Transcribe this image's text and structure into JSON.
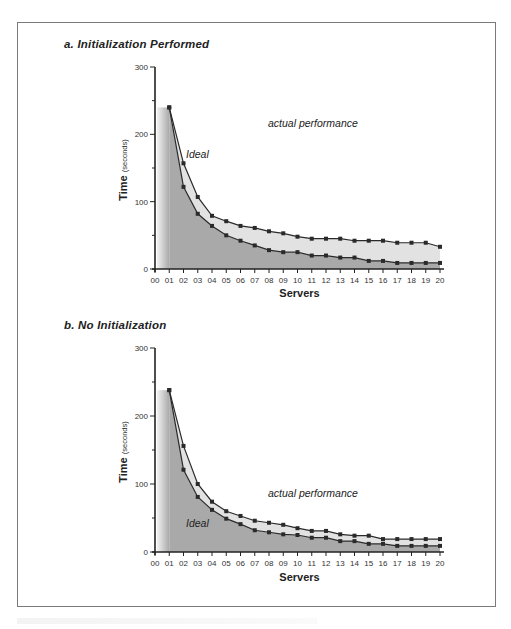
{
  "figure": {
    "colors": {
      "ideal_fill": "#a9a9a9",
      "actual_fill": "#e2e2e2",
      "line": "#2a2a2a",
      "frame": "#7a7a7a"
    }
  },
  "panels": [
    {
      "title": "a. Initialization Performed",
      "xlabel": "Servers",
      "ylabel": "Time",
      "ylabel_unit": "(seconds)",
      "annot_actual": "actual performance",
      "annot_ideal": "Ideal"
    },
    {
      "title": "b. No Initialization",
      "xlabel": "Servers",
      "ylabel": "Time",
      "ylabel_unit": "(seconds)",
      "annot_actual": "actual performance",
      "annot_ideal": "Ideal"
    }
  ],
  "chart_data": [
    {
      "type": "area",
      "title": "a. Initialization Performed",
      "xlabel": "Servers",
      "ylabel": "Time (seconds)",
      "categories": [
        "00",
        "01",
        "02",
        "03",
        "04",
        "05",
        "06",
        "07",
        "08",
        "09",
        "10",
        "11",
        "12",
        "13",
        "14",
        "15",
        "16",
        "17",
        "18",
        "19",
        "20"
      ],
      "ylim": [
        0,
        300
      ],
      "yticks": [
        0,
        100,
        200,
        300
      ],
      "grid": false,
      "legend": "inline annotations",
      "series": [
        {
          "name": "actual performance",
          "start": "01",
          "values": [
            240,
            157,
            107,
            79,
            71,
            64,
            61,
            56,
            53,
            48,
            45,
            45,
            45,
            42,
            42,
            42,
            39,
            39,
            39,
            33
          ]
        },
        {
          "name": "Ideal",
          "start": "01",
          "values": [
            240,
            122,
            82,
            64,
            50,
            42,
            35,
            28,
            25,
            25,
            20,
            20,
            17,
            17,
            12,
            12,
            9,
            9,
            9,
            9
          ]
        }
      ]
    },
    {
      "type": "area",
      "title": "b. No Initialization",
      "xlabel": "Servers",
      "ylabel": "Time (seconds)",
      "categories": [
        "00",
        "01",
        "02",
        "03",
        "04",
        "05",
        "06",
        "07",
        "08",
        "09",
        "10",
        "11",
        "12",
        "13",
        "14",
        "15",
        "16",
        "17",
        "18",
        "19",
        "20"
      ],
      "ylim": [
        0,
        300
      ],
      "yticks": [
        0,
        100,
        200,
        300
      ],
      "grid": false,
      "legend": "inline annotations",
      "series": [
        {
          "name": "actual performance",
          "start": "01",
          "values": [
            238,
            156,
            100,
            74,
            60,
            53,
            46,
            43,
            40,
            35,
            31,
            31,
            26,
            24,
            24,
            19,
            19,
            19,
            19,
            19
          ]
        },
        {
          "name": "Ideal",
          "start": "01",
          "values": [
            238,
            121,
            81,
            62,
            49,
            41,
            32,
            29,
            26,
            25,
            21,
            21,
            16,
            16,
            12,
            12,
            9,
            9,
            9,
            9
          ]
        }
      ]
    }
  ]
}
